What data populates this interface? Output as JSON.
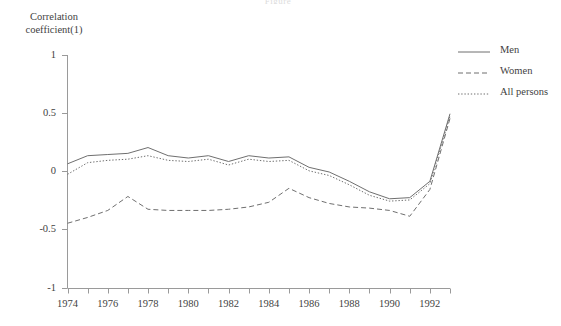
{
  "title_fragment": "Figure",
  "axis": {
    "y_label_line1": "Correlation",
    "y_label_line2": "coefficient(1)",
    "y_ticks": [
      "1",
      "0.5",
      "0",
      "-0.5",
      "-1"
    ],
    "x_ticks": [
      "1974",
      "1976",
      "1978",
      "1980",
      "1982",
      "1984",
      "1986",
      "1988",
      "1990",
      "1992"
    ]
  },
  "legend": {
    "items": [
      {
        "label": "Men",
        "style": "solid",
        "color": "#6f6f6f"
      },
      {
        "label": "Women",
        "style": "dashed",
        "color": "#6f6f6f"
      },
      {
        "label": "All persons",
        "style": "dotted",
        "color": "#6f6f6f"
      }
    ]
  },
  "chart_data": {
    "type": "line",
    "title": "",
    "xlabel": "",
    "ylabel": "Correlation coefficient(1)",
    "xlim": [
      1974,
      1993
    ],
    "ylim": [
      -1,
      1
    ],
    "yticks": [
      -1,
      -0.5,
      0,
      0.5,
      1
    ],
    "xticks": [
      1974,
      1975,
      1976,
      1977,
      1978,
      1979,
      1980,
      1981,
      1982,
      1983,
      1984,
      1985,
      1986,
      1987,
      1988,
      1989,
      1990,
      1991,
      1992,
      1993
    ],
    "xtick_labels_every": 2,
    "grid": false,
    "legend_position": "right",
    "x": [
      1974,
      1975,
      1976,
      1977,
      1978,
      1979,
      1980,
      1981,
      1982,
      1983,
      1984,
      1985,
      1986,
      1987,
      1988,
      1989,
      1990,
      1991,
      1992,
      1993
    ],
    "series": [
      {
        "name": "Men",
        "style": "solid",
        "color": "#6f6f6f",
        "values": [
          0.07,
          0.14,
          0.15,
          0.16,
          0.21,
          0.14,
          0.12,
          0.14,
          0.09,
          0.14,
          0.12,
          0.13,
          0.04,
          0.0,
          -0.08,
          -0.17,
          -0.23,
          -0.22,
          -0.08,
          0.5
        ]
      },
      {
        "name": "Women",
        "style": "dashed",
        "color": "#6f6f6f",
        "values": [
          -0.44,
          -0.39,
          -0.33,
          -0.21,
          -0.32,
          -0.33,
          -0.33,
          -0.33,
          -0.32,
          -0.3,
          -0.26,
          -0.14,
          -0.22,
          -0.27,
          -0.3,
          -0.31,
          -0.33,
          -0.38,
          -0.15,
          0.46
        ]
      },
      {
        "name": "All persons",
        "style": "dotted",
        "color": "#6f6f6f",
        "values": [
          -0.02,
          0.08,
          0.1,
          0.11,
          0.14,
          0.1,
          0.09,
          0.11,
          0.06,
          0.11,
          0.09,
          0.1,
          0.01,
          -0.03,
          -0.11,
          -0.2,
          -0.25,
          -0.24,
          -0.1,
          0.48
        ]
      }
    ]
  }
}
